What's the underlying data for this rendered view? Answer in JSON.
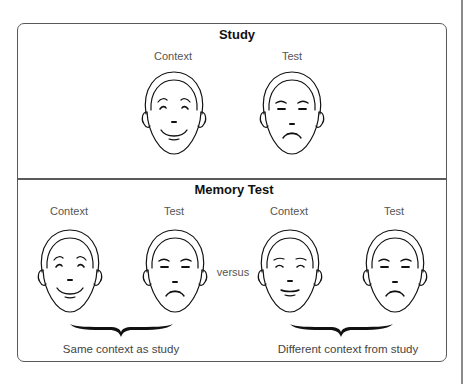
{
  "study": {
    "title": "Study",
    "context_label": "Context",
    "test_label": "Test",
    "faces": [
      {
        "role": "context",
        "expression": "smiling"
      },
      {
        "role": "test",
        "expression": "frowning"
      }
    ]
  },
  "memory_test": {
    "title": "Memory Test",
    "separator": "versus",
    "groups": [
      {
        "context_label": "Context",
        "test_label": "Test",
        "caption": "Same context as study",
        "faces": [
          {
            "role": "context",
            "expression": "smiling"
          },
          {
            "role": "test",
            "expression": "frowning"
          }
        ]
      },
      {
        "context_label": "Context",
        "test_label": "Test",
        "caption": "Different context from study",
        "faces": [
          {
            "role": "context",
            "expression": "neutral"
          },
          {
            "role": "test",
            "expression": "frowning"
          }
        ]
      }
    ]
  },
  "colors": {
    "line": "#111111",
    "frame": "#5a5a5a",
    "label": "#555555"
  }
}
